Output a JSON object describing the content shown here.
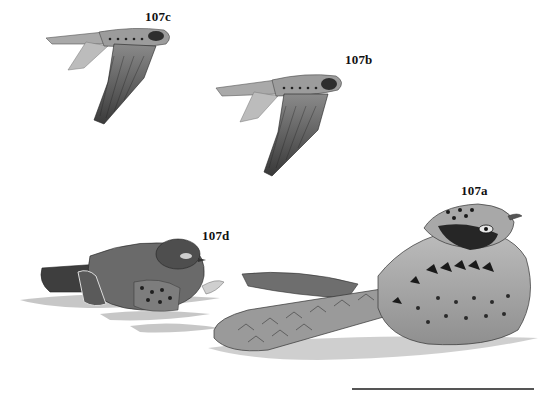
{
  "plate": {
    "background": "#ffffff",
    "figures": [
      {
        "id": "107c",
        "label": "107c",
        "pose": "flying",
        "label_pos": [
          145,
          17
        ]
      },
      {
        "id": "107b",
        "label": "107b",
        "pose": "flying",
        "label_pos": [
          345,
          60
        ]
      },
      {
        "id": "107a",
        "label": "107a",
        "pose": "resting",
        "label_pos": [
          461,
          191
        ]
      },
      {
        "id": "107d",
        "label": "107d",
        "pose": "resting-crouched",
        "label_pos": [
          202,
          236
        ]
      }
    ],
    "scale_bar": {
      "x1": 352,
      "x2": 534,
      "y": 389,
      "color": "#555555"
    }
  }
}
